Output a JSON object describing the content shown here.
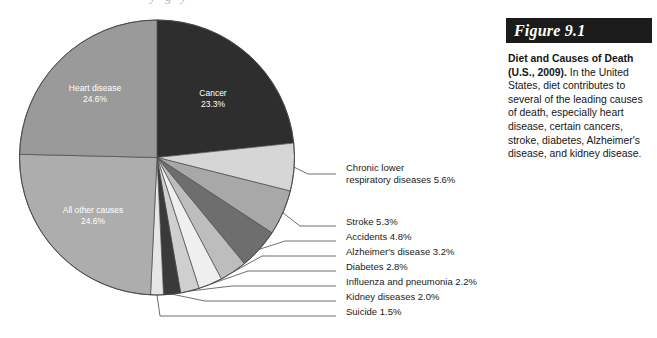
{
  "chart_data": {
    "type": "pie",
    "title": "Diet and Causes of Death (U.S., 2009)",
    "unit": "percent",
    "start_angle_deg": -90,
    "direction": "clockwise",
    "categories": [
      "Cancer",
      "Chronic lower respiratory diseases",
      "Stroke",
      "Accidents",
      "Alzheimer's disease",
      "Diabetes",
      "Influenza and pneumonia",
      "Kidney diseases",
      "Suicide",
      "All other causes",
      "Heart disease"
    ],
    "values": [
      23.3,
      5.6,
      5.3,
      4.8,
      3.2,
      2.8,
      2.2,
      2.0,
      1.5,
      24.6,
      24.6
    ],
    "colors": [
      "#2e2e2e",
      "#d6d6d6",
      "#a8a8a8",
      "#6e6e6e",
      "#bdbdbd",
      "#efefef",
      "#cfcfcf",
      "#3a3a3a",
      "#e6e6e6",
      "#adadad",
      "#9a9a9a"
    ],
    "inside_labels": [
      {
        "name": "Cancer",
        "value_text": "23.3%"
      },
      {
        "name": "Heart disease",
        "value_text": "24.6%"
      },
      {
        "name": "All other causes",
        "value_text": "24.6%"
      }
    ],
    "callouts": [
      {
        "line1": "Chronic lower",
        "line2": "respiratory diseases 5.6%"
      },
      {
        "line1": "Stroke 5.3%"
      },
      {
        "line1": "Accidents 4.8%"
      },
      {
        "line1": "Alzheimer's disease 3.2%"
      },
      {
        "line1": "Diabetes 2.8%"
      },
      {
        "line1": "Influenza and pneumonia 2.2%"
      },
      {
        "line1": "Kidney diseases 2.0%"
      },
      {
        "line1": "Suicide 1.5%"
      }
    ],
    "legend_position": "callout-labels",
    "grid": false
  },
  "caption": {
    "figure_number": "Figure 9.1",
    "lead": "Diet and Causes of Death (U.S., 2009).",
    "body": " In the United States, diet contributes to several of the leading causes of death, especially heart disease, certain cancers, stroke, diabetes, Alzheimer's disease, and kidney disease.",
    "bar_color": "#1b1b1b",
    "bar_text_color": "#ffffff"
  },
  "top_crop_ghost": "y g y"
}
